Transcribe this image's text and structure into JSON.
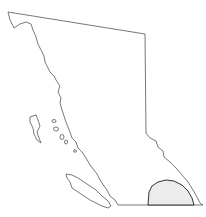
{
  "map": {
    "subject": "British Columbia outline",
    "highlighted_region": "southeast region",
    "colors": {
      "outline": "#555555",
      "region_fill": "#ececec",
      "region_stroke": "#333333",
      "background": "#ffffff"
    }
  }
}
